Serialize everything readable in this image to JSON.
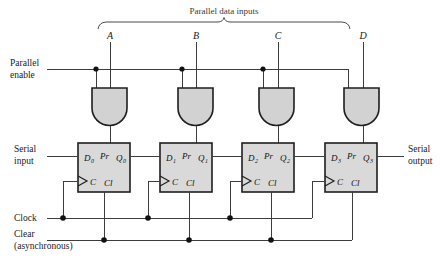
{
  "figure": {
    "title": "Parallel data inputs",
    "type": "logic-diagram"
  },
  "labels": {
    "parallel_data_inputs": "Parallel data inputs",
    "parallel_enable_line1": "Parallel",
    "parallel_enable_line2": "enable",
    "serial_input_line1": "Serial",
    "serial_input_line2": "input",
    "serial_output_line1": "Serial",
    "serial_output_line2": "output",
    "clock": "Clock",
    "clear_line1": "Clear",
    "clear_line2": "(asynchronous)"
  },
  "data_inputs": [
    {
      "name": "A"
    },
    {
      "name": "B"
    },
    {
      "name": "C"
    },
    {
      "name": "D"
    }
  ],
  "flipflops": [
    {
      "d": "D",
      "d_sub": "0",
      "pr": "Pr",
      "q": "Q",
      "q_sub": "0",
      "c": "C",
      "cl": "Cl"
    },
    {
      "d": "D",
      "d_sub": "1",
      "pr": "Pr",
      "q": "Q",
      "q_sub": "1",
      "c": "C",
      "cl": "Cl"
    },
    {
      "d": "D",
      "d_sub": "2",
      "pr": "Pr",
      "q": "Q",
      "q_sub": "2",
      "c": "C",
      "cl": "Cl"
    },
    {
      "d": "D",
      "d_sub": "3",
      "pr": "Pr",
      "q": "Q",
      "q_sub": "3",
      "c": "C",
      "cl": "Cl"
    }
  ],
  "gates": {
    "type": "AND",
    "count": 4
  },
  "colors": {
    "box_fill": "#d9d9d9",
    "gate_fill": "#d2d2d2",
    "stroke": "#1e1e1e",
    "wire": "#3d3d3d",
    "text": "#1a1a1a",
    "background": "#ffffff"
  }
}
